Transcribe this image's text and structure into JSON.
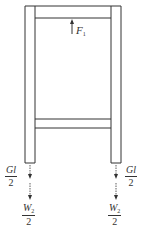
{
  "diagram": {
    "type": "frame free-body diagram",
    "colors": {
      "stroke": "#333333",
      "background": "#ffffff"
    },
    "labels": {
      "force_top": {
        "symbol": "F",
        "subscript": "1"
      },
      "left_gl": {
        "numerator": "Gl",
        "denominator": "2"
      },
      "right_gl": {
        "numerator": "Gl",
        "denominator": "2"
      },
      "left_w": {
        "numerator": "W",
        "numerator_sub": "2",
        "denominator": "2"
      },
      "right_w": {
        "numerator": "W",
        "numerator_sub": "2",
        "denominator": "2"
      }
    }
  }
}
